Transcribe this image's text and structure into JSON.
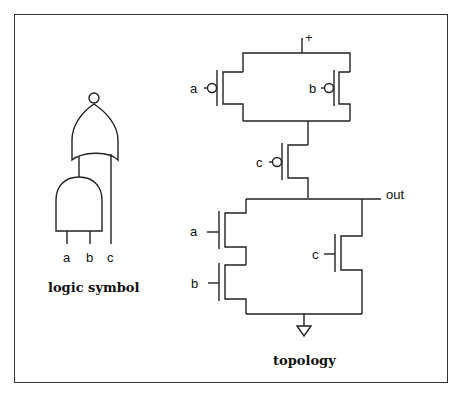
{
  "diagram": {
    "logic_symbol": {
      "caption": "logic symbol",
      "inputs": [
        "a",
        "b",
        "c"
      ],
      "gates": [
        "AND (a, b)",
        "NOR (AND output, c)"
      ],
      "output_bubble": true
    },
    "topology": {
      "caption": "topology",
      "supply_label": "+",
      "output_label": "out",
      "pull_up": [
        {
          "name": "pmos-a",
          "gate_label": "a",
          "type": "PMOS"
        },
        {
          "name": "pmos-b",
          "gate_label": "b",
          "type": "PMOS"
        },
        {
          "name": "pmos-c",
          "gate_label": "c",
          "type": "PMOS"
        }
      ],
      "pull_down": [
        {
          "name": "nmos-a",
          "gate_label": "a",
          "type": "NMOS"
        },
        {
          "name": "nmos-b",
          "gate_label": "b",
          "type": "NMOS"
        },
        {
          "name": "nmos-c",
          "gate_label": "c",
          "type": "NMOS"
        }
      ],
      "ground_symbol": "ground"
    }
  }
}
